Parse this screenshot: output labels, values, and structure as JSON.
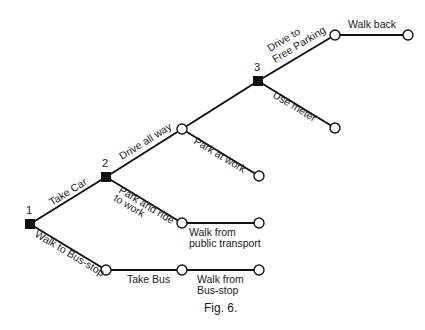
{
  "figure": {
    "caption": "Fig. 6.",
    "type": "decision-tree",
    "colors": {
      "line": "#111111",
      "background": "#ffffff"
    }
  },
  "decision_nodes": [
    {
      "id": "1",
      "label": "1"
    },
    {
      "id": "2",
      "label": "2"
    },
    {
      "id": "3",
      "label": "3"
    }
  ],
  "branches": {
    "take_car": "Take Car",
    "walk_to_bus_stop": "Walk to Bus-stop",
    "drive_all_way": "Drive all way",
    "park_and_ride_line1": "Park and ride",
    "park_and_ride_line2": "to work",
    "park_at_work": "Park at work",
    "drive_free_line1": "Drive to",
    "drive_free_line2": "Free Parking",
    "use_meter": "Use meter",
    "walk_back": "Walk back",
    "walk_public_line1": "Walk from",
    "walk_public_line2": "public transport",
    "take_bus": "Take Bus",
    "walk_busstop_line1": "Walk from",
    "walk_busstop_line2": "Bus-stop"
  }
}
